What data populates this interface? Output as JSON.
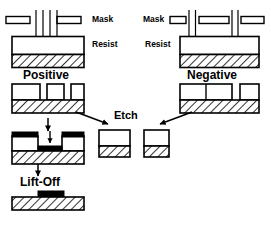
{
  "figure": {
    "colors": {
      "outline": "#000000",
      "fill": "#ffffff",
      "metal": "#000000",
      "substrate_hatch": "#000000",
      "background": "#ffffff"
    },
    "labels": [
      {
        "id": "mask-left",
        "text": "Mask",
        "x": 92,
        "y": 17,
        "size": "sm"
      },
      {
        "id": "resist-left",
        "text": "Resist",
        "x": 92,
        "y": 42,
        "size": "sm"
      },
      {
        "id": "mask-right",
        "text": "Mask",
        "x": 143,
        "y": 17,
        "size": "sm"
      },
      {
        "id": "resist-right",
        "text": "Resist",
        "x": 151,
        "y": 42,
        "size": "sm"
      },
      {
        "id": "positive-title",
        "text": "Positive",
        "x": 25,
        "y": 72,
        "size": "lg"
      },
      {
        "id": "negative-title",
        "text": "Negative",
        "x": 188,
        "y": 72,
        "size": "lg"
      },
      {
        "id": "etch-title",
        "text": "Etch",
        "x": 117,
        "y": 114,
        "size": "md"
      },
      {
        "id": "liftoff-title",
        "text": "Lift-Off",
        "x": 22,
        "y": 179,
        "size": "lg"
      }
    ],
    "panels": {
      "exposure_positive": {
        "name": "positive-exposure-panel",
        "mask_segments": 2,
        "beams": 4,
        "beam_region": "center",
        "layers": [
          "resist",
          "substrate"
        ]
      },
      "exposure_negative": {
        "name": "negative-exposure-panel",
        "mask_segments": 3,
        "beams": 4,
        "beam_region": "two-gaps",
        "layers": [
          "resist",
          "substrate"
        ]
      },
      "positive_developed": {
        "name": "positive-developed-panel",
        "openings": 2,
        "layers": [
          "resist",
          "substrate"
        ]
      },
      "negative_developed": {
        "name": "negative-developed-panel",
        "openings": 1,
        "layers": [
          "resist",
          "substrate"
        ]
      },
      "metal_deposition": {
        "name": "metal-deposition-panel",
        "layers": [
          "metal",
          "resist",
          "substrate"
        ]
      },
      "liftoff_result": {
        "name": "liftoff-result-panel",
        "layers": [
          "metal",
          "substrate"
        ]
      },
      "etch_result_left": {
        "name": "etch-result-left-panel",
        "layers": [
          "void",
          "substrate"
        ]
      },
      "etch_result_right": {
        "name": "etch-result-right-panel",
        "layers": [
          "void",
          "substrate"
        ]
      }
    },
    "arrows": [
      {
        "id": "positive-to-etch",
        "from": "positive-developed-panel",
        "to": "etch-title"
      },
      {
        "id": "negative-to-etch",
        "from": "negative-developed-panel",
        "to": "etch-title"
      },
      {
        "id": "positive-to-metal",
        "from": "positive-developed-panel",
        "to": "metal-deposition-panel"
      },
      {
        "id": "metal-to-liftoff",
        "from": "metal-deposition-panel",
        "to": "liftoff-result-panel"
      }
    ]
  }
}
